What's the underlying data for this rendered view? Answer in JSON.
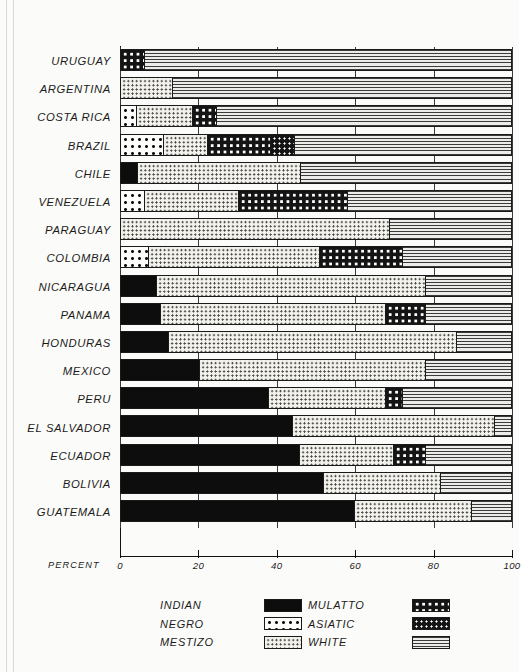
{
  "chart_data": {
    "type": "bar",
    "orientation": "horizontal",
    "stacked": true,
    "title": "",
    "xlabel": "PERCENT",
    "ylabel": "",
    "xlim": [
      0,
      100
    ],
    "xticks": [
      0,
      20,
      40,
      60,
      80,
      100
    ],
    "xtick_labels": [
      "0",
      "20",
      "40",
      "60",
      "80",
      "100"
    ],
    "grid": true,
    "legend_position": "bottom",
    "categories": [
      "URUGUAY",
      "ARGENTINA",
      "COSTA RICA",
      "BRAZIL",
      "CHILE",
      "VENEZUELA",
      "PARAGUAY",
      "COLOMBIA",
      "NICARAGUA",
      "PANAMA",
      "HONDURAS",
      "MEXICO",
      "PERU",
      "EL SALVADOR",
      "ECUADOR",
      "BOLIVIA",
      "GUATEMALA"
    ],
    "series": [
      {
        "name": "INDIAN",
        "pattern": "solid-black",
        "values": [
          0,
          0,
          0,
          0,
          4,
          0,
          0,
          0,
          9,
          10,
          12,
          20,
          38,
          44,
          46,
          52,
          60
        ]
      },
      {
        "name": "NEGRO",
        "pattern": "white-with-black-dots",
        "values": [
          0,
          0,
          4,
          11,
          0,
          6,
          0,
          7,
          0,
          0,
          0,
          0,
          0,
          0,
          0,
          0,
          0
        ]
      },
      {
        "name": "MESTIZO",
        "pattern": "light-fine-dots",
        "values": [
          0,
          13,
          14,
          11,
          42,
          24,
          69,
          44,
          69,
          58,
          74,
          58,
          30,
          52,
          24,
          30,
          30
        ]
      },
      {
        "name": "MULATTO",
        "pattern": "black-with-large-white-dots",
        "values": [
          6,
          0,
          6,
          16,
          0,
          28,
          0,
          21,
          0,
          10,
          0,
          0,
          4,
          0,
          8,
          0,
          0
        ]
      },
      {
        "name": "ASIATIC",
        "pattern": "black-with-small-white-dots",
        "values": [
          0,
          0,
          0,
          6,
          0,
          0,
          0,
          0,
          0,
          0,
          0,
          0,
          0,
          0,
          0,
          0,
          0
        ]
      },
      {
        "name": "WHITE",
        "pattern": "horizontal-lines",
        "values": [
          94,
          87,
          76,
          56,
          54,
          42,
          31,
          28,
          22,
          22,
          14,
          22,
          28,
          4,
          22,
          18,
          10
        ]
      }
    ]
  },
  "legend": {
    "column_one": [
      {
        "label": "INDIAN",
        "pattern": "indian"
      },
      {
        "label": "NEGRO",
        "pattern": "negro"
      },
      {
        "label": "MESTIZO",
        "pattern": "mestizo"
      }
    ],
    "column_two": [
      {
        "label": "MULATTO",
        "pattern": "mulatto"
      },
      {
        "label": "ASIATIC",
        "pattern": "asiatic"
      },
      {
        "label": "WHITE",
        "pattern": "white"
      }
    ]
  },
  "axis": {
    "percent_caption": "PERCENT"
  }
}
